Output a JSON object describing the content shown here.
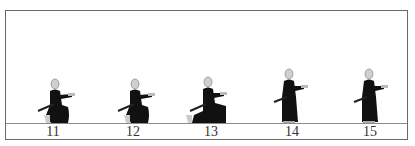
{
  "diagram": {
    "colors": {
      "frame": "#6a6a6a",
      "ground": "#8a8a8a",
      "robe": "#111111",
      "head": "#cfcfcf"
    },
    "frames": [
      {
        "label": "11",
        "pose": "kneeling-draw"
      },
      {
        "label": "12",
        "pose": "kneeling-draw"
      },
      {
        "label": "13",
        "pose": "kneeling-extended"
      },
      {
        "label": "14",
        "pose": "standing-draw"
      },
      {
        "label": "15",
        "pose": "standing-draw"
      }
    ]
  }
}
